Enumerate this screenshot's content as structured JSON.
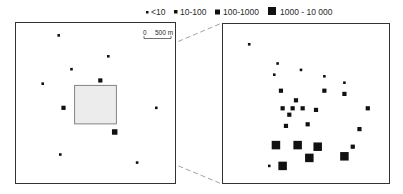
{
  "legend": {
    "items": [
      {
        "label": "<10",
        "size_class": "small"
      },
      {
        "label": "10-100",
        "size_class": "medium"
      },
      {
        "label": "100-1000",
        "size_class": "large"
      },
      {
        "label": "1000 - 10 000",
        "size_class": "xlarge"
      }
    ]
  },
  "scale_bar": {
    "start_label": "0",
    "end_label": "500 m"
  },
  "colors": {
    "marker": "#111111",
    "frame": "#333333",
    "highlight_fill": "#ececec",
    "connector": "#8a8a8a"
  },
  "overview_map": {
    "points": [
      {
        "x": 0.27,
        "y": 0.08,
        "size_class": "small"
      },
      {
        "x": 0.58,
        "y": 0.21,
        "size_class": "small"
      },
      {
        "x": 0.35,
        "y": 0.29,
        "size_class": "small"
      },
      {
        "x": 0.17,
        "y": 0.38,
        "size_class": "small"
      },
      {
        "x": 0.53,
        "y": 0.36,
        "size_class": "medium"
      },
      {
        "x": 0.3,
        "y": 0.53,
        "size_class": "medium"
      },
      {
        "x": 0.88,
        "y": 0.53,
        "size_class": "small"
      },
      {
        "x": 0.62,
        "y": 0.68,
        "size_class": "large"
      },
      {
        "x": 0.28,
        "y": 0.82,
        "size_class": "small"
      },
      {
        "x": 0.76,
        "y": 0.87,
        "size_class": "small"
      }
    ],
    "highlight": {
      "x0": 0.37,
      "y0": 0.39,
      "x1": 0.63,
      "y1": 0.63
    }
  },
  "detail_map": {
    "points": [
      {
        "x": 0.16,
        "y": 0.13,
        "size_class": "small"
      },
      {
        "x": 0.33,
        "y": 0.25,
        "size_class": "small"
      },
      {
        "x": 0.31,
        "y": 0.32,
        "size_class": "small"
      },
      {
        "x": 0.47,
        "y": 0.29,
        "size_class": "small"
      },
      {
        "x": 0.61,
        "y": 0.33,
        "size_class": "small"
      },
      {
        "x": 0.73,
        "y": 0.37,
        "size_class": "small"
      },
      {
        "x": 0.35,
        "y": 0.42,
        "size_class": "medium"
      },
      {
        "x": 0.61,
        "y": 0.42,
        "size_class": "medium"
      },
      {
        "x": 0.73,
        "y": 0.44,
        "size_class": "medium"
      },
      {
        "x": 0.44,
        "y": 0.48,
        "size_class": "medium"
      },
      {
        "x": 0.36,
        "y": 0.53,
        "size_class": "medium"
      },
      {
        "x": 0.42,
        "y": 0.53,
        "size_class": "medium"
      },
      {
        "x": 0.48,
        "y": 0.53,
        "size_class": "medium"
      },
      {
        "x": 0.56,
        "y": 0.54,
        "size_class": "medium"
      },
      {
        "x": 0.4,
        "y": 0.57,
        "size_class": "medium"
      },
      {
        "x": 0.87,
        "y": 0.53,
        "size_class": "medium"
      },
      {
        "x": 0.38,
        "y": 0.64,
        "size_class": "medium"
      },
      {
        "x": 0.51,
        "y": 0.63,
        "size_class": "medium"
      },
      {
        "x": 0.82,
        "y": 0.66,
        "size_class": "medium"
      },
      {
        "x": 0.32,
        "y": 0.76,
        "size_class": "xlarge"
      },
      {
        "x": 0.45,
        "y": 0.76,
        "size_class": "xlarge"
      },
      {
        "x": 0.57,
        "y": 0.77,
        "size_class": "xlarge"
      },
      {
        "x": 0.73,
        "y": 0.83,
        "size_class": "xlarge"
      },
      {
        "x": 0.78,
        "y": 0.77,
        "size_class": "medium"
      },
      {
        "x": 0.52,
        "y": 0.84,
        "size_class": "xlarge"
      },
      {
        "x": 0.28,
        "y": 0.89,
        "size_class": "small"
      },
      {
        "x": 0.36,
        "y": 0.89,
        "size_class": "xlarge"
      }
    ]
  }
}
